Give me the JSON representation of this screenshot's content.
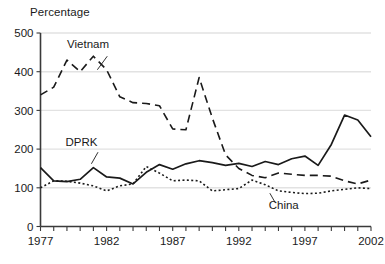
{
  "chart_data": {
    "type": "line",
    "title": "Percentage",
    "ylabel": "Percentage",
    "xlabel": "",
    "grid": true,
    "legend_position": "inline-labels",
    "xlim": [
      1977,
      2002
    ],
    "ylim": [
      0,
      500
    ],
    "yticks": [
      0,
      100,
      200,
      300,
      400,
      500
    ],
    "ytick_labels": [
      "0",
      "100",
      "200",
      "300",
      "400",
      "500"
    ],
    "xticks": [
      1977,
      1978,
      1979,
      1980,
      1981,
      1982,
      1983,
      1984,
      1985,
      1986,
      1987,
      1988,
      1989,
      1990,
      1991,
      1992,
      1993,
      1994,
      1995,
      1996,
      1997,
      1998,
      1999,
      2000,
      2001,
      2002
    ],
    "xtick_labels_shown": [
      "1977",
      "1982",
      "1987",
      "1992",
      "1997",
      "2002"
    ],
    "xtick_labels_shown_at": [
      1977,
      1982,
      1987,
      1992,
      1997,
      2002
    ],
    "x": [
      1977,
      1978,
      1979,
      1980,
      1981,
      1982,
      1983,
      1984,
      1985,
      1986,
      1987,
      1988,
      1989,
      1990,
      1991,
      1992,
      1993,
      1994,
      1995,
      1996,
      1997,
      1998,
      1999,
      2000,
      2001,
      2002
    ],
    "series": [
      {
        "name": "Vietnam",
        "style": "dashed",
        "label": "Vietnam",
        "values": [
          340,
          360,
          430,
          400,
          440,
          405,
          335,
          320,
          318,
          312,
          252,
          250,
          385,
          280,
          185,
          150,
          132,
          126,
          138,
          135,
          132,
          132,
          130,
          118,
          110,
          120
        ]
      },
      {
        "name": "DPRK",
        "style": "solid",
        "label": "DPRK",
        "values": [
          152,
          118,
          116,
          122,
          152,
          128,
          125,
          110,
          140,
          160,
          148,
          162,
          170,
          165,
          158,
          163,
          155,
          168,
          160,
          175,
          182,
          158,
          212,
          288,
          275,
          232
        ]
      },
      {
        "name": "China",
        "style": "dotted",
        "label": "China",
        "values": [
          100,
          118,
          117,
          112,
          105,
          92,
          105,
          110,
          155,
          138,
          118,
          120,
          118,
          92,
          95,
          98,
          120,
          108,
          92,
          88,
          85,
          86,
          92,
          96,
          100,
          98
        ]
      }
    ],
    "annotations": [
      {
        "text": "Vietnam",
        "x": 1980.6,
        "y": 460
      },
      {
        "text": "DPRK",
        "x": 1980.1,
        "y": 208
      },
      {
        "text": "China",
        "x": 1995.4,
        "y": 45
      }
    ]
  }
}
